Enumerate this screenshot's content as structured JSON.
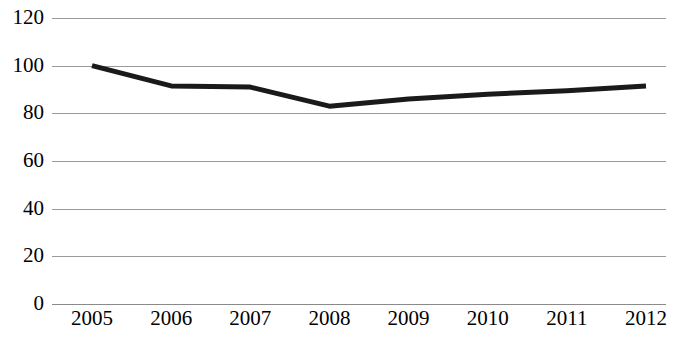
{
  "chart_data": {
    "type": "line",
    "title": "",
    "subtitle": "",
    "xlabel": "",
    "ylabel": "",
    "categories": [
      "2005",
      "2006",
      "2007",
      "2008",
      "2009",
      "2010",
      "2011",
      "2012"
    ],
    "x": [
      2005,
      2006,
      2007,
      2008,
      2009,
      2010,
      2011,
      2012
    ],
    "series": [
      {
        "name": "Index",
        "values": [
          100,
          91.5,
          91,
          83,
          86,
          88,
          89.5,
          91.5
        ],
        "color": "#1a1a1a",
        "line_width": 5,
        "marker": "none"
      }
    ],
    "ylim": [
      0,
      120
    ],
    "yticks": [
      0,
      20,
      40,
      60,
      80,
      100,
      120
    ],
    "ytick_labels": [
      "0",
      "20",
      "40",
      "60",
      "80",
      "100",
      "120"
    ],
    "xtick_labels": [
      "2005",
      "2006",
      "2007",
      "2008",
      "2009",
      "2010",
      "2011",
      "2012"
    ],
    "grid": {
      "horizontal": true,
      "vertical": false,
      "color": "#9a9a9a"
    },
    "legend": {
      "visible": false,
      "position": "none",
      "entries": []
    },
    "axis": {
      "y_axis_line": false,
      "x_axis_line": true,
      "background": "#ffffff"
    },
    "annotations": []
  }
}
